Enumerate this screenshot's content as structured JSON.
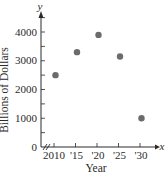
{
  "chart_data": {
    "type": "scatter",
    "title": "",
    "xlabel": "Year",
    "ylabel": "Billions of Dollars",
    "x_axis_variable": "x",
    "y_axis_variable": "y",
    "x": [
      2010,
      2015,
      2020,
      2025,
      2030
    ],
    "x_tick_labels": [
      "2010",
      "'15",
      "'20",
      "'25",
      "'30"
    ],
    "y_ticks": [
      0,
      1000,
      2000,
      3000,
      4000
    ],
    "y_tick_labels": [
      "0",
      "1000",
      "2000",
      "3000",
      "4000"
    ],
    "series": [
      {
        "name": "Billions of Dollars",
        "values": [
          2500,
          3300,
          3900,
          3150,
          1000
        ]
      }
    ],
    "ylim": [
      0,
      4500
    ],
    "xlim": [
      2010,
      2032
    ],
    "axis_break": true,
    "grid": false,
    "legend": "none",
    "colors": {
      "axis": "#2a2a2a",
      "point": "#6b6b6b"
    }
  }
}
